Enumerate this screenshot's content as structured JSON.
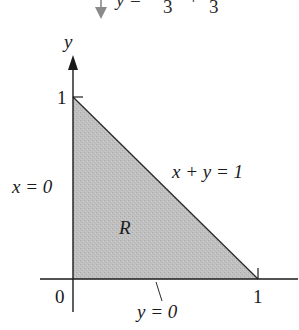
{
  "header_fragment": {
    "arrow_icon": "down-arrow-icon",
    "arrow_color": "#8a8a8a",
    "y_var": "y",
    "equals": "=",
    "denominator_1": "3",
    "plus": "+",
    "denominator_2": "3"
  },
  "diagram": {
    "type": "region-plot",
    "axes": {
      "x_axis_label": "",
      "y_axis_label": "y",
      "origin_label": "0",
      "x_tick_label": "1",
      "y_tick_label": "1"
    },
    "boundaries": {
      "left": "x = 0",
      "bottom": "y = 0",
      "hypotenuse": "x + y = 1"
    },
    "region_label": "R",
    "region_vertices": [
      [
        0,
        0
      ],
      [
        1,
        0
      ],
      [
        0,
        1
      ]
    ],
    "colors": {
      "region_fill": "#bdbdbd",
      "axis": "#1a1a1a",
      "text": "#1a1a1a"
    }
  }
}
